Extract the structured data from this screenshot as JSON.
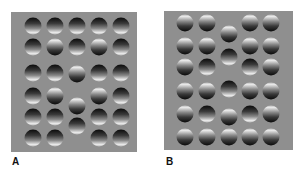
{
  "figure": {
    "panels": [
      {
        "label": "A",
        "box": {
          "x": 11,
          "y": 12,
          "w": 126,
          "h": 140
        },
        "label_pos": {
          "x": 12,
          "y": 156
        },
        "balls": [
          {
            "x": 33,
            "y": 26,
            "type": "concave"
          },
          {
            "x": 55,
            "y": 26,
            "type": "concave"
          },
          {
            "x": 77,
            "y": 26,
            "type": "concave"
          },
          {
            "x": 99,
            "y": 26,
            "type": "concave"
          },
          {
            "x": 121,
            "y": 26,
            "type": "concave"
          },
          {
            "x": 33,
            "y": 47,
            "type": "concave"
          },
          {
            "x": 55,
            "y": 47,
            "type": "convex"
          },
          {
            "x": 77,
            "y": 47,
            "type": "concave"
          },
          {
            "x": 99,
            "y": 47,
            "type": "convex"
          },
          {
            "x": 121,
            "y": 47,
            "type": "concave"
          },
          {
            "x": 33,
            "y": 73,
            "type": "concave"
          },
          {
            "x": 55,
            "y": 73,
            "type": "concave"
          },
          {
            "x": 77,
            "y": 74,
            "type": "convex"
          },
          {
            "x": 99,
            "y": 73,
            "type": "concave"
          },
          {
            "x": 121,
            "y": 73,
            "type": "concave"
          },
          {
            "x": 33,
            "y": 96,
            "type": "concave"
          },
          {
            "x": 55,
            "y": 96,
            "type": "convex"
          },
          {
            "x": 77,
            "y": 106,
            "type": "convex"
          },
          {
            "x": 99,
            "y": 96,
            "type": "convex"
          },
          {
            "x": 121,
            "y": 96,
            "type": "concave"
          },
          {
            "x": 33,
            "y": 117,
            "type": "concave"
          },
          {
            "x": 55,
            "y": 117,
            "type": "concave"
          },
          {
            "x": 77,
            "y": 126,
            "type": "concave"
          },
          {
            "x": 99,
            "y": 117,
            "type": "concave"
          },
          {
            "x": 121,
            "y": 117,
            "type": "concave"
          },
          {
            "x": 33,
            "y": 138,
            "type": "concave"
          },
          {
            "x": 55,
            "y": 138,
            "type": "concave"
          },
          {
            "x": 99,
            "y": 138,
            "type": "concave"
          },
          {
            "x": 121,
            "y": 138,
            "type": "concave"
          }
        ]
      },
      {
        "label": "B",
        "box": {
          "x": 164,
          "y": 11,
          "w": 129,
          "h": 139
        },
        "label_pos": {
          "x": 166,
          "y": 156
        },
        "balls": [
          {
            "x": 185,
            "y": 23,
            "type": "convex"
          },
          {
            "x": 207,
            "y": 23,
            "type": "convex"
          },
          {
            "x": 229,
            "y": 34,
            "type": "convex"
          },
          {
            "x": 250,
            "y": 23,
            "type": "convex"
          },
          {
            "x": 271,
            "y": 23,
            "type": "convex"
          },
          {
            "x": 185,
            "y": 46,
            "type": "convex"
          },
          {
            "x": 207,
            "y": 46,
            "type": "convex"
          },
          {
            "x": 229,
            "y": 57,
            "type": "concave"
          },
          {
            "x": 250,
            "y": 46,
            "type": "convex"
          },
          {
            "x": 271,
            "y": 46,
            "type": "convex"
          },
          {
            "x": 185,
            "y": 67,
            "type": "convex"
          },
          {
            "x": 207,
            "y": 67,
            "type": "concave"
          },
          {
            "x": 250,
            "y": 67,
            "type": "concave"
          },
          {
            "x": 271,
            "y": 67,
            "type": "convex"
          },
          {
            "x": 185,
            "y": 91,
            "type": "convex"
          },
          {
            "x": 207,
            "y": 91,
            "type": "convex"
          },
          {
            "x": 229,
            "y": 89,
            "type": "concave"
          },
          {
            "x": 250,
            "y": 91,
            "type": "convex"
          },
          {
            "x": 271,
            "y": 91,
            "type": "convex"
          },
          {
            "x": 185,
            "y": 114,
            "type": "convex"
          },
          {
            "x": 207,
            "y": 114,
            "type": "concave"
          },
          {
            "x": 229,
            "y": 117,
            "type": "convex"
          },
          {
            "x": 250,
            "y": 114,
            "type": "concave"
          },
          {
            "x": 271,
            "y": 114,
            "type": "convex"
          },
          {
            "x": 185,
            "y": 137,
            "type": "convex"
          },
          {
            "x": 207,
            "y": 137,
            "type": "convex"
          },
          {
            "x": 229,
            "y": 137,
            "type": "convex"
          },
          {
            "x": 250,
            "y": 137,
            "type": "convex"
          },
          {
            "x": 271,
            "y": 137,
            "type": "convex"
          }
        ]
      }
    ],
    "colors": {
      "panel_background": "#8f8f8f",
      "page_background": "#ffffff",
      "label": "#111111"
    }
  }
}
